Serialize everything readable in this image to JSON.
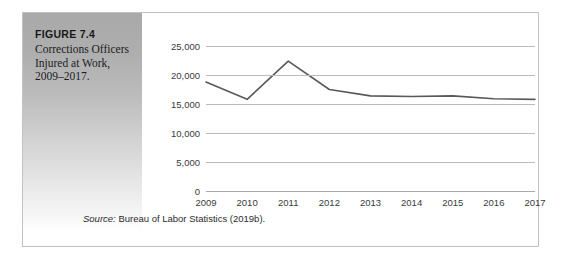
{
  "figure": {
    "number_label": "FIGURE 7.4",
    "caption": "Corrections Officers Injured at Work, 2009–2017.",
    "source_prefix": "Source:",
    "source_text": " Bureau of Labor Statistics (2019b)."
  },
  "colors": {
    "panel_gray_top": "#a9a9a9",
    "panel_gray_bottom": "#ffffff",
    "gridline": "#b9bcbe",
    "line_series": "#595959",
    "frame_border": "#bfc3c6",
    "text": "#1b1b1e"
  },
  "chart_data": {
    "type": "line",
    "title": "Corrections Officers Injured at Work, 2009–2017.",
    "xlabel": "",
    "ylabel": "",
    "categories": [
      "2009",
      "2010",
      "2011",
      "2012",
      "2013",
      "2014",
      "2015",
      "2016",
      "2017"
    ],
    "values": [
      18800,
      15800,
      22400,
      17500,
      16400,
      16300,
      16400,
      15900,
      15800
    ],
    "ylim": [
      0,
      25000
    ],
    "yticks": [
      0,
      5000,
      10000,
      15000,
      20000,
      25000
    ],
    "ytick_labels": [
      "0",
      "5,000",
      "10,000",
      "15,000",
      "20,000",
      "25,000"
    ],
    "grid": true,
    "legend": "none",
    "series": [
      {
        "name": "Corrections officers injured at work",
        "values": [
          18800,
          15800,
          22400,
          17500,
          16400,
          16300,
          16400,
          15900,
          15800
        ]
      }
    ]
  }
}
